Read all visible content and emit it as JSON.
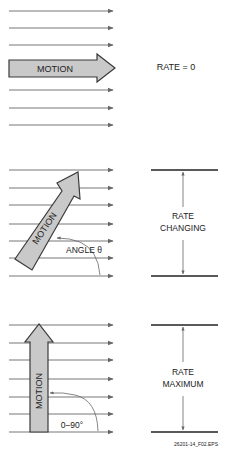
{
  "figure": {
    "panels": [
      {
        "id": "rate-zero",
        "arrow_label": "MOTION",
        "arrow_orientation": "horizontal",
        "rate_label": "RATE = 0"
      },
      {
        "id": "rate-changing",
        "arrow_label": "MOTION",
        "arrow_orientation": "diagonal",
        "angle_label": "ANGLE θ",
        "rate_label_line1": "RATE",
        "rate_label_line2": "CHANGING"
      },
      {
        "id": "rate-maximum",
        "arrow_label": "MOTION",
        "arrow_orientation": "vertical",
        "angle_label": "0–90°",
        "rate_label_line1": "RATE",
        "rate_label_line2": "MAXIMUM"
      }
    ],
    "figure_id": "26201-14_F02.EPS"
  },
  "colors": {
    "flux_line": "#777777",
    "arrow_fill": "#c9c9c9",
    "arrow_stroke": "#3a3a3a",
    "bar": "#222222"
  }
}
